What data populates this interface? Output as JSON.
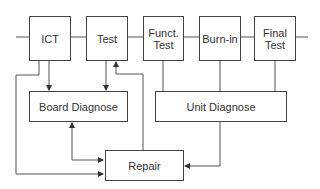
{
  "diagram": {
    "stages": [
      {
        "id": "ict",
        "label": "ICT"
      },
      {
        "id": "test",
        "label": "Test"
      },
      {
        "id": "funct-test",
        "label": "Funct.\nTest"
      },
      {
        "id": "burn-in",
        "label": "Burn-in"
      },
      {
        "id": "final-test",
        "label": "Final\nTest"
      }
    ],
    "diagnose": {
      "board": "Board Diagnose",
      "unit": "Unit Diagnose"
    },
    "repair": "Repair",
    "connections": [
      {
        "from": "ICT",
        "to": "Board Diagnose",
        "arrow": true
      },
      {
        "from": "Test",
        "to": "Board Diagnose",
        "arrow": true
      },
      {
        "from": "ICT",
        "to": "Repair",
        "arrow": true
      },
      {
        "from": "Board Diagnose",
        "to": "Repair",
        "arrow": "both"
      },
      {
        "from": "Repair",
        "to": "Test",
        "arrow": true
      },
      {
        "from": "Funct. Test",
        "to": "Unit Diagnose",
        "arrow": false
      },
      {
        "from": "Burn-in",
        "to": "Unit Diagnose",
        "arrow": false
      },
      {
        "from": "Final Test",
        "to": "Unit Diagnose",
        "arrow": false
      },
      {
        "from": "Unit Diagnose",
        "to": "Repair",
        "arrow": true
      }
    ]
  }
}
